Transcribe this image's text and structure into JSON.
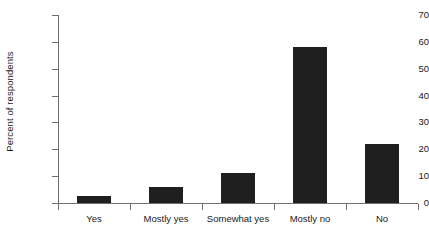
{
  "chart_data": {
    "type": "bar",
    "title": "",
    "subtitle": "",
    "xlabel": "",
    "ylabel": "Percent of respondents",
    "categories": [
      "Yes",
      "Mostly yes",
      "Somewhat yes",
      "Mostly no",
      "No"
    ],
    "values": [
      2.5,
      6,
      11,
      58,
      22
    ],
    "ylim": [
      0,
      70
    ],
    "ytick_labels": [
      "0",
      "10",
      "20",
      "30",
      "40",
      "50",
      "60",
      "70"
    ],
    "ytick_values": [
      0,
      10,
      20,
      30,
      40,
      50,
      60,
      70
    ],
    "grid": false,
    "legend": null,
    "legend_position": "none",
    "bar_color": "#1f1f1f",
    "axis_color": "#6e6e6e",
    "background_color": "#ffffff",
    "text_color": "#1a1a1a"
  }
}
